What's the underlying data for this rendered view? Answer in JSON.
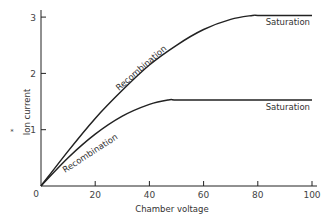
{
  "chart_data": {
    "type": "line",
    "title": "",
    "xlabel": "Chamber voltage",
    "ylabel": "Ion current",
    "xlim": [
      0,
      100
    ],
    "ylim": [
      0,
      3.1
    ],
    "x_ticks": [
      "0",
      "20",
      "40",
      "60",
      "80",
      "100"
    ],
    "y_ticks": [
      "1",
      "2",
      "3"
    ],
    "grid": false,
    "legend": "none",
    "series": [
      {
        "name": "Upper curve",
        "x": [
          0,
          10,
          20,
          30,
          40,
          50,
          60,
          70,
          78,
          80,
          90,
          100
        ],
        "y": [
          0,
          0.62,
          1.2,
          1.7,
          2.15,
          2.5,
          2.78,
          2.96,
          3.03,
          3.03,
          3.03,
          3.03
        ]
      },
      {
        "name": "Lower curve",
        "x": [
          0,
          10,
          20,
          30,
          40,
          47,
          50,
          60,
          70,
          80,
          90,
          100
        ],
        "y": [
          0,
          0.5,
          0.92,
          1.24,
          1.45,
          1.53,
          1.53,
          1.53,
          1.53,
          1.53,
          1.53,
          1.53
        ]
      }
    ],
    "annotations": [
      {
        "text": "Recombination",
        "series": "Upper curve",
        "region": "rising"
      },
      {
        "text": "Saturation",
        "series": "Upper curve",
        "region": "plateau"
      },
      {
        "text": "Recombination",
        "series": "Lower curve",
        "region": "rising"
      },
      {
        "text": "Saturation",
        "series": "Lower curve",
        "region": "plateau"
      }
    ]
  },
  "labels": {
    "xlabel": "Chamber voltage",
    "ylabel": "Ion current",
    "origin": "0",
    "star": "*",
    "ann_upper_recomb": "Recombination",
    "ann_upper_sat": "Saturation",
    "ann_lower_recomb": "Recombination",
    "ann_lower_sat": "Saturation",
    "xticks": [
      "20",
      "40",
      "60",
      "80",
      "100"
    ],
    "yticks": [
      "1",
      "2",
      "3"
    ]
  }
}
